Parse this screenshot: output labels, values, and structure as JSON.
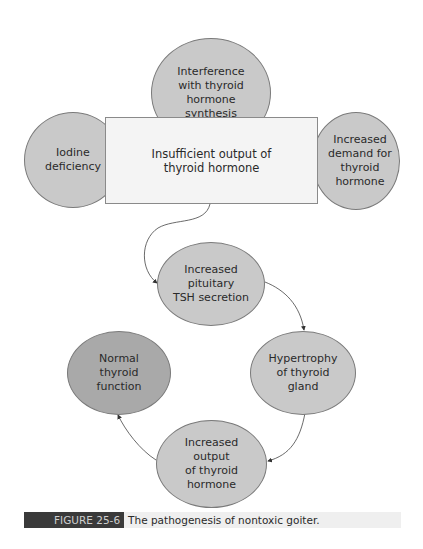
{
  "diagram": {
    "nodes": {
      "interference": "Interference\nwith thyroid\nhormone\nsynthesis",
      "iodine": "Iodine\ndeficiency",
      "insufficient": "Insufficient output of\nthyroid hormone",
      "demand": "Increased\ndemand for\nthyroid\nhormone",
      "tsh": "Increased\npituitary\nTSH secretion",
      "hypertrophy": "Hypertrophy\nof thyroid\ngland",
      "output": "Increased\noutput\nof thyroid\nhormone",
      "normal": "Normal\nthyroid\nfunction"
    },
    "colors": {
      "node_fill": "#c9c9c9",
      "normal_fill": "#a9a9a9",
      "box_fill": "#f4f4f4"
    }
  },
  "caption": {
    "label": "FIGURE 25-6",
    "text": "The pathogenesis of nontoxic goiter."
  }
}
